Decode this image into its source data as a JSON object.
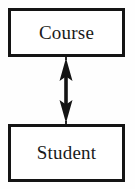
{
  "diagram": {
    "type": "entity-relationship",
    "background_color": "#fefefe",
    "stroke_color": "#141414",
    "text_color": "#1a1a1a",
    "entities": [
      {
        "id": "course",
        "label": "Course",
        "position": "top"
      },
      {
        "id": "student",
        "label": "Student",
        "position": "bottom"
      }
    ],
    "connector": {
      "icon": "double-headed-vertical-arrow-icon",
      "style": "bidirectional",
      "from": "Course",
      "to": "Student",
      "color": "#141414"
    }
  }
}
